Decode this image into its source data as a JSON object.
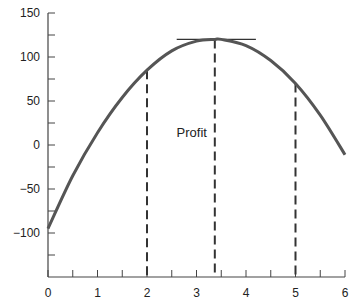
{
  "chart_data": {
    "type": "line",
    "title": "",
    "xlabel": "",
    "ylabel": "",
    "xlim": [
      0,
      6
    ],
    "ylim": [
      -150,
      150
    ],
    "x_ticks": [
      0,
      1,
      2,
      3,
      4,
      5,
      6
    ],
    "x_minor_step": 0.5,
    "y_ticks": [
      150,
      100,
      50,
      0,
      -50,
      -100
    ],
    "y_minor_step": 25,
    "grid": false,
    "legend": null,
    "series": [
      {
        "name": "Profit curve",
        "color": "#555555",
        "x": [
          0,
          0.5,
          1,
          1.5,
          2,
          2.5,
          3,
          3.37,
          3.5,
          4,
          4.5,
          5,
          5.5,
          6
        ],
        "values": [
          -95,
          -35,
          14,
          54,
          85,
          107,
          118,
          120,
          120,
          113,
          96,
          70,
          34,
          -11
        ]
      }
    ],
    "annotations": [
      {
        "type": "text",
        "text": "Profit",
        "x": 2.8,
        "y": 15
      },
      {
        "type": "vline-dashed",
        "x": 2,
        "y_top": 85
      },
      {
        "type": "vline-dashed",
        "x": 3.37,
        "y_top": 120
      },
      {
        "type": "vline-dashed",
        "x": 5,
        "y_top": 70
      },
      {
        "type": "hline-tangent",
        "y": 120,
        "x_from": 2.6,
        "x_to": 4.2
      }
    ]
  },
  "labels": {
    "annotation": "Profit",
    "x_ticks": [
      "0",
      "1",
      "2",
      "3",
      "4",
      "5",
      "6"
    ],
    "y_ticks": [
      "150",
      "100",
      "50",
      "0",
      "−50",
      "−100"
    ]
  }
}
